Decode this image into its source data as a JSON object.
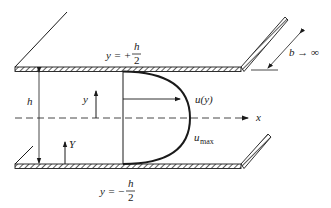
{
  "diagram": {
    "labels": {
      "top_wall_eq_lhs": "y = +",
      "top_wall_num": "h",
      "top_wall_den": "2",
      "bottom_wall_eq_lhs": "y = −",
      "bottom_wall_num": "h",
      "bottom_wall_den": "2",
      "gap": "h",
      "local_y": "y",
      "wall_Y": "Y",
      "velocity": "u(y)",
      "umax_u": "u",
      "umax_sub": "max",
      "axis_x": "x",
      "width_b": "b → ∞"
    },
    "colors": {
      "stroke": "#1a1a1a",
      "background": "#ffffff"
    }
  }
}
